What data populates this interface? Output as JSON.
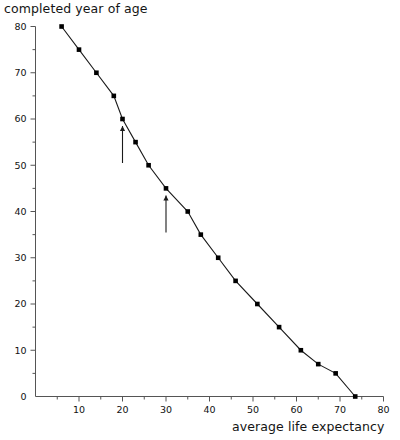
{
  "chart_data": {
    "type": "line",
    "title": "",
    "xlabel": "average life expectancy",
    "ylabel": "completed year of age",
    "xlim": [
      0,
      80
    ],
    "ylim": [
      0,
      80
    ],
    "grid": false,
    "legend": null,
    "x_ticks_major": [
      10,
      20,
      30,
      40,
      50,
      60,
      70,
      80
    ],
    "x_ticks_minor": [
      5,
      15,
      25,
      35,
      45,
      55,
      65,
      75
    ],
    "y_ticks_major": [
      0,
      10,
      20,
      30,
      40,
      50,
      60,
      70,
      80
    ],
    "y_ticks_minor": [
      5,
      15,
      25,
      35,
      45,
      55,
      65,
      75
    ],
    "x_tick_labels": [
      "10",
      "20",
      "30",
      "40",
      "50",
      "60",
      "70",
      "80"
    ],
    "y_tick_labels": [
      "0",
      "10",
      "20",
      "30",
      "40",
      "50",
      "60",
      "70",
      "80"
    ],
    "marker": "square",
    "series": [
      {
        "name": "completed year of age vs average life expectancy",
        "x": [
          6,
          10,
          14,
          18,
          20,
          23,
          26,
          30,
          35,
          38,
          42,
          46,
          51,
          56,
          61,
          65,
          67,
          71,
          73.5
        ],
        "y": [
          80,
          75,
          70,
          65,
          60,
          55,
          50,
          45,
          40,
          35,
          30,
          25,
          20,
          15,
          10,
          5,
          10,
          5,
          0
        ],
        "points": [
          {
            "x": 6,
            "y": 80
          },
          {
            "x": 10,
            "y": 75
          },
          {
            "x": 14,
            "y": 70
          },
          {
            "x": 18,
            "y": 65
          },
          {
            "x": 20,
            "y": 60
          },
          {
            "x": 23,
            "y": 55
          },
          {
            "x": 26,
            "y": 50
          },
          {
            "x": 30,
            "y": 45
          },
          {
            "x": 35,
            "y": 40
          },
          {
            "x": 38,
            "y": 35
          },
          {
            "x": 42,
            "y": 30
          },
          {
            "x": 46,
            "y": 25
          },
          {
            "x": 51,
            "y": 20
          },
          {
            "x": 56,
            "y": 15
          },
          {
            "x": 61,
            "y": 10
          },
          {
            "x": 65,
            "y": 7
          },
          {
            "x": 69,
            "y": 5
          },
          {
            "x": 73.5,
            "y": 0
          }
        ]
      }
    ],
    "annotations": [
      {
        "name": "arrow-1",
        "type": "arrow-up",
        "x": 20,
        "y": 60,
        "length": 8
      },
      {
        "name": "arrow-2",
        "type": "arrow-up",
        "x": 30,
        "y": 45,
        "length": 8
      }
    ],
    "colors": {
      "line": "#1a1a1a",
      "marker": "#000000",
      "axis": "#555555",
      "text": "#111111",
      "background": "#ffffff"
    }
  }
}
